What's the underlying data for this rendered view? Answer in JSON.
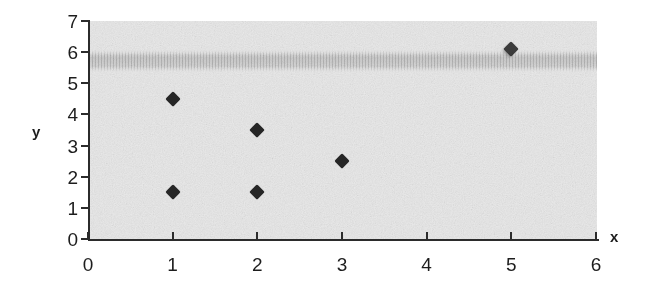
{
  "chart_data": {
    "type": "scatter",
    "title": "",
    "subtitle": "",
    "xlabel": "x",
    "ylabel": "y",
    "xlim": [
      0,
      6
    ],
    "ylim": [
      0,
      7
    ],
    "xticks": [
      "0",
      "1",
      "2",
      "3",
      "4",
      "5",
      "6"
    ],
    "yticks": [
      "0",
      "1",
      "2",
      "3",
      "4",
      "5",
      "6",
      "7"
    ],
    "xtick_values": [
      0,
      1,
      2,
      3,
      4,
      5,
      6
    ],
    "ytick_values": [
      0,
      1,
      2,
      3,
      4,
      5,
      6,
      7
    ],
    "grid": false,
    "legend": null,
    "marker_style": "diamond",
    "marker_color": "#262626",
    "plot_background": "#e9e9e9",
    "figure_background": "#ffffff",
    "axis_color": "#2b2b2b",
    "points": [
      {
        "x": 1,
        "y": 4.5,
        "label": ""
      },
      {
        "x": 1,
        "y": 1.5,
        "label": ""
      },
      {
        "x": 2,
        "y": 3.5,
        "label": ""
      },
      {
        "x": 2,
        "y": 1.5,
        "label": ""
      },
      {
        "x": 3,
        "y": 2.5,
        "label": ""
      },
      {
        "x": 5,
        "y": 6.1,
        "label": ""
      }
    ],
    "annotations": [
      {
        "name": "scan-streak-band",
        "description": "horizontal scanner artifact streak across plot",
        "y_center": 5.9,
        "y_span": [
          5.6,
          6.3
        ]
      }
    ]
  }
}
